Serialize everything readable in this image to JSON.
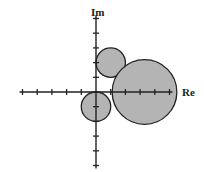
{
  "diagram": {
    "type": "complex-plane-circles",
    "axes": {
      "x_label": "Re",
      "y_label": "Im",
      "origin_px": [
        96,
        92
      ],
      "tick_spacing_px": 14.7,
      "x_ticks": [
        -5,
        -4,
        -3,
        -2,
        -1,
        1,
        2,
        3,
        4,
        5
      ],
      "y_ticks": [
        -5,
        -4,
        -3,
        -2,
        -1,
        1,
        2,
        3,
        4,
        5
      ]
    },
    "circles": [
      {
        "name": "upper-circle",
        "center": [
          1,
          2
        ],
        "radius": 1
      },
      {
        "name": "right-circle",
        "center": [
          3.3,
          0
        ],
        "radius": 2.2
      },
      {
        "name": "lower-circle",
        "center": [
          0,
          -1
        ],
        "radius": 1
      }
    ],
    "colors": {
      "fill": "#b4b4b4",
      "stroke": "#222222",
      "axis": "#222222",
      "background": "#ffffff"
    }
  }
}
